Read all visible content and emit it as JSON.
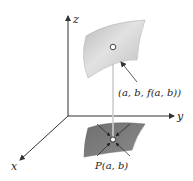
{
  "diagram": {
    "axes": {
      "x_label": "x",
      "y_label": "y",
      "z_label": "z"
    },
    "surface_point_label": "(a, b, f(a, b))",
    "domain_point_label": "P(a, b)",
    "colors": {
      "surface": "#c8c8c8",
      "domain_region": "#7a7a7a",
      "axes": "#333333",
      "projection_line": "#cfcfcf"
    }
  }
}
